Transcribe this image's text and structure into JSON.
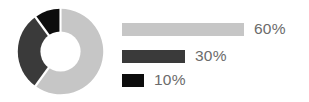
{
  "chart_data": {
    "type": "pie",
    "variant": "donut",
    "title": "",
    "subtitle": "",
    "xlabel": "",
    "ylabel": "",
    "legend_position": "right",
    "grid": false,
    "hole_ratio": 0.47,
    "start_angle_deg": 0,
    "direction": "clockwise",
    "categories": [
      "60%",
      "30%",
      "10%"
    ],
    "values": [
      60,
      30,
      10
    ],
    "labels": [
      "60%",
      "30%",
      "10%"
    ],
    "colors": [
      "#c6c6c6",
      "#3a3a3a",
      "#0d0d0d"
    ],
    "slices": [
      {
        "label": "60%",
        "value": 60,
        "color": "#c6c6c6",
        "bar_width_px": 122
      },
      {
        "label": "30%",
        "value": 30,
        "color": "#3a3a3a",
        "bar_width_px": 63
      },
      {
        "label": "10%",
        "value": 10,
        "color": "#0d0d0d",
        "bar_width_px": 22
      }
    ]
  },
  "legend": {
    "items": [
      {
        "label": "60%",
        "color": "#c6c6c6"
      },
      {
        "label": "30%",
        "color": "#3a3a3a"
      },
      {
        "label": "10%",
        "color": "#0d0d0d"
      }
    ]
  },
  "style": {
    "background": "#ffffff",
    "label_color": "#6b6b6b",
    "separator_color": "#ffffff"
  }
}
